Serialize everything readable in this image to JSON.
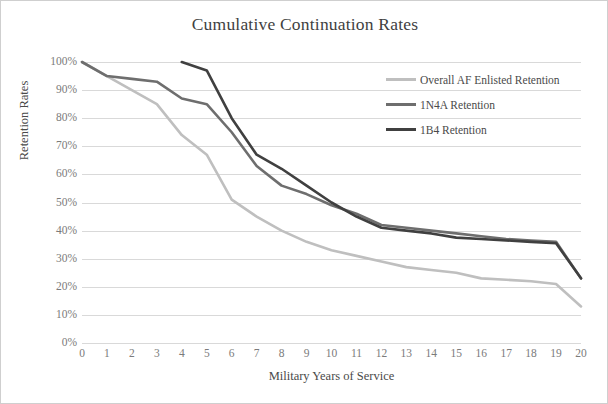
{
  "chart_data": {
    "type": "line",
    "title": "Cumulative Continuation Rates",
    "xlabel": "Military Years of Service",
    "ylabel": "Retention Rates",
    "x": [
      0,
      1,
      2,
      3,
      4,
      5,
      6,
      7,
      8,
      9,
      10,
      11,
      12,
      13,
      14,
      15,
      16,
      17,
      18,
      19,
      20
    ],
    "xtick_labels": [
      "0",
      "1",
      "2",
      "3",
      "4",
      "5",
      "6",
      "7",
      "8",
      "9",
      "10",
      "11",
      "12",
      "13",
      "14",
      "15",
      "16",
      "17",
      "18",
      "19",
      "20"
    ],
    "ytick_labels": [
      "100%",
      "90%",
      "80%",
      "70%",
      "60%",
      "50%",
      "40%",
      "30%",
      "20%",
      "10%",
      "0%"
    ],
    "ytick_values": [
      100,
      90,
      80,
      70,
      60,
      50,
      40,
      30,
      20,
      10,
      0
    ],
    "xlim": [
      0,
      20
    ],
    "ylim": [
      0,
      100
    ],
    "grid": "horizontal",
    "legend_position": "inside-top-right",
    "series": [
      {
        "name": "Overall AF Enlisted Retention",
        "color": "#bfbfbf",
        "x": [
          0,
          1,
          2,
          3,
          4,
          5,
          6,
          7,
          8,
          9,
          10,
          11,
          12,
          13,
          14,
          15,
          16,
          17,
          18,
          19,
          20
        ],
        "values": [
          100,
          95,
          90,
          85,
          74,
          67,
          51,
          45,
          40,
          36,
          33,
          31,
          29,
          27,
          26,
          25,
          23,
          22.5,
          22,
          21,
          13
        ]
      },
      {
        "name": "1N4A Retention",
        "color": "#6e6e6e",
        "x": [
          0,
          1,
          2,
          3,
          4,
          5,
          6,
          7,
          8,
          9,
          10,
          11,
          12,
          13,
          14,
          15,
          16,
          17,
          18,
          19,
          20
        ],
        "values": [
          100,
          95,
          94,
          93,
          87,
          85,
          75,
          63,
          56,
          53,
          49,
          46,
          42,
          41,
          40,
          39,
          38,
          37,
          36.5,
          36,
          23
        ]
      },
      {
        "name": "1B4 Retention",
        "color": "#404040",
        "x": [
          4,
          5,
          6,
          7,
          8,
          9,
          10,
          11,
          12,
          13,
          14,
          15,
          16,
          17,
          18,
          19,
          20
        ],
        "values": [
          100,
          97,
          80,
          67,
          62,
          56,
          50,
          45,
          41,
          40,
          39,
          37.5,
          37,
          36.5,
          36,
          35.5,
          23
        ]
      }
    ]
  },
  "legend": {
    "items": [
      {
        "label": "Overall AF Enlisted Retention",
        "color": "#bfbfbf"
      },
      {
        "label": "1N4A Retention",
        "color": "#6e6e6e"
      },
      {
        "label": "1B4 Retention",
        "color": "#404040"
      }
    ]
  }
}
